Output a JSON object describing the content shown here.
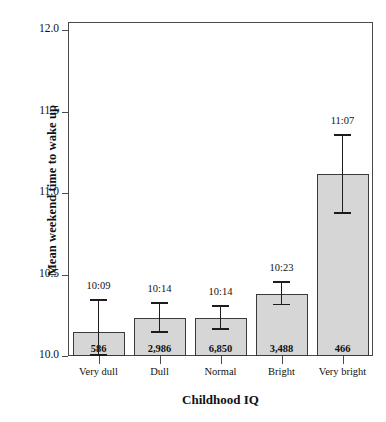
{
  "chart_data": {
    "type": "bar",
    "title": "",
    "xlabel": "Childhood IQ",
    "ylabel": "Mean weekend time to wake up",
    "categories": [
      "Very dull",
      "Dull",
      "Normal",
      "Bright",
      "Very bright"
    ],
    "values": [
      10.15,
      10.233,
      10.233,
      10.383,
      11.117
    ],
    "value_labels": [
      "10:09",
      "10:14",
      "10:14",
      "10:23",
      "11:07"
    ],
    "sample_sizes": [
      "586",
      "2,986",
      "6,850",
      "3,488",
      "466"
    ],
    "error_low": [
      10.0,
      10.14,
      10.16,
      10.31,
      10.87
    ],
    "error_high": [
      10.35,
      10.33,
      10.31,
      10.46,
      11.36
    ],
    "ylim": [
      10.0,
      12.05
    ],
    "yticks": [
      "10.0",
      "10.5",
      "11.0",
      "11.5",
      "12.0"
    ],
    "ytick_values": [
      10.0,
      10.5,
      11.0,
      11.5,
      12.0
    ],
    "grid": false,
    "legend": "none",
    "bar_color": "#d6d6d6",
    "bar_edge_color": "#3a3a3a",
    "error_color": "#1c1c1c",
    "axis_color": "#4a4a4a"
  }
}
